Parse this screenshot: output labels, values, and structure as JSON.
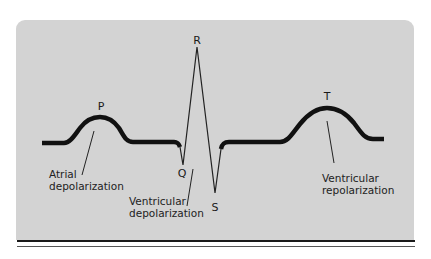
{
  "diagram": {
    "type": "ecg-waveform",
    "background_color": "#d3d3d3",
    "trace_color": "#111111",
    "waves": {
      "p": "P",
      "q": "Q",
      "r": "R",
      "s": "S",
      "t": "T"
    },
    "annotations": {
      "atrial": {
        "line1": "Atrial",
        "line2": "depolarization"
      },
      "ventricular_dep": {
        "line1": "Ventricular",
        "line2": "depolarization"
      },
      "ventricular_rep": {
        "line1": "Ventricular",
        "line2": "repolarization"
      }
    }
  }
}
